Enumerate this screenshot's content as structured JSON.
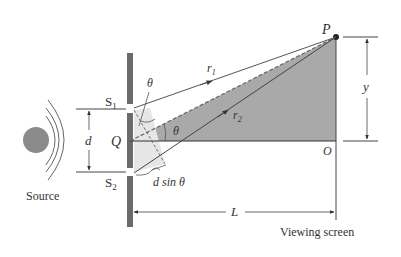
{
  "diagram": {
    "labels": {
      "source": "Source",
      "s1": "S",
      "s1_sub": "1",
      "s2": "S",
      "s2_sub": "2",
      "q": "Q",
      "d": "d",
      "theta_top": "θ",
      "theta_mid": "θ",
      "r1": "r",
      "r1_sub": "1",
      "r2": "r",
      "r2_sub": "2",
      "p": "P",
      "y": "y",
      "o": "O",
      "L": "L",
      "dsintheta": "d sin θ",
      "viewing_screen": "Viewing screen"
    },
    "colors": {
      "barrier": "#6b6b6b",
      "shaded_triangle": "#a9a9a9",
      "light_wedge": "#e6e6e6",
      "source_ball": "#8a8a8a",
      "lines": "#444444"
    }
  }
}
